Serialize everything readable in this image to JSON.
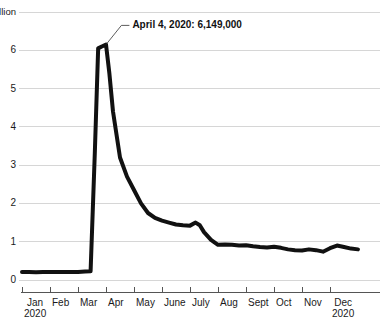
{
  "chart_data": {
    "type": "line",
    "title": "",
    "subtitle": "",
    "xlabel": "",
    "ylabel": "",
    "unit_label": "7 million",
    "ylim": [
      0,
      7
    ],
    "yticks": [
      0,
      1,
      2,
      3,
      4,
      5,
      6,
      7
    ],
    "ytick_labels": [
      "0",
      "1",
      "2",
      "3",
      "4",
      "5",
      "6",
      "7 million"
    ],
    "grid": true,
    "legend": "none",
    "xlim": [
      "2020-01-01",
      "2020-12-31"
    ],
    "categories": [
      "Jan",
      "Feb",
      "Mar",
      "Apr",
      "May",
      "June",
      "July",
      "Aug",
      "Sept",
      "Oct",
      "Nov",
      "Dec"
    ],
    "xtick_labels": [
      {
        "month": "Jan",
        "year": "2020"
      },
      {
        "month": "Feb",
        "year": ""
      },
      {
        "month": "Mar",
        "year": ""
      },
      {
        "month": "Apr",
        "year": ""
      },
      {
        "month": "May",
        "year": ""
      },
      {
        "month": "June",
        "year": ""
      },
      {
        "month": "July",
        "year": ""
      },
      {
        "month": "Aug",
        "year": ""
      },
      {
        "month": "Sept",
        "year": ""
      },
      {
        "month": "Oct",
        "year": ""
      },
      {
        "month": "Nov",
        "year": ""
      },
      {
        "month": "Dec",
        "year": "2020"
      }
    ],
    "series": [
      {
        "name": "Weekly initial unemployment claims",
        "color": "#111111",
        "x": [
          0.0,
          0.25,
          0.5,
          0.75,
          1.0,
          1.25,
          1.5,
          1.75,
          2.0,
          2.25,
          2.45,
          2.6,
          2.72,
          2.85,
          3.0,
          3.12,
          3.25,
          3.5,
          3.75,
          4.0,
          4.25,
          4.5,
          4.75,
          5.0,
          5.25,
          5.5,
          5.75,
          6.0,
          6.2,
          6.35,
          6.5,
          6.75,
          7.0,
          7.25,
          7.5,
          7.75,
          8.0,
          8.25,
          8.5,
          8.75,
          9.0,
          9.25,
          9.5,
          9.75,
          10.0,
          10.25,
          10.5,
          10.75,
          11.0,
          11.25,
          11.5,
          11.75,
          12.0
        ],
        "values": [
          0.21,
          0.21,
          0.2,
          0.21,
          0.21,
          0.21,
          0.21,
          0.21,
          0.21,
          0.22,
          0.23,
          3.31,
          6.05,
          6.1,
          6.149,
          5.4,
          4.4,
          3.2,
          2.7,
          2.35,
          2.0,
          1.75,
          1.62,
          1.55,
          1.5,
          1.45,
          1.43,
          1.42,
          1.5,
          1.43,
          1.25,
          1.05,
          0.92,
          0.93,
          0.92,
          0.9,
          0.91,
          0.88,
          0.86,
          0.85,
          0.87,
          0.84,
          0.8,
          0.78,
          0.77,
          0.8,
          0.78,
          0.74,
          0.83,
          0.9,
          0.86,
          0.82,
          0.8
        ]
      }
    ],
    "annotations": [
      {
        "text": "April 4, 2020: 6,149,000",
        "point_x": 3.0,
        "point_y": 6.149,
        "label_x": 3.55,
        "label_y": 6.65,
        "date": "April 4, 2020",
        "value": "6,149,000",
        "value_numeric": 6149000
      }
    ],
    "style": {
      "line_color": "#111111",
      "line_width": 4,
      "grid_color": "#d6d6d6",
      "axis_color": "#555555",
      "background": "#ffffff",
      "text_color": "#1a1a1a"
    }
  }
}
